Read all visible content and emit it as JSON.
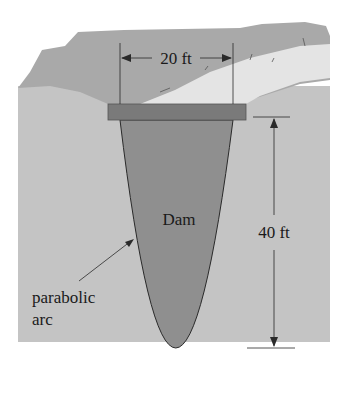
{
  "figure": {
    "dam_label": "Dam",
    "width_label": "20 ft",
    "height_label": "40 ft",
    "curve_label_line1": "parabolic",
    "curve_label_line2": "arc"
  },
  "colors": {
    "ground": "#c4c4c4",
    "hillside": "#a9a9a9",
    "water": "#e4e4e4",
    "dam_body": "#8f8f8f",
    "dam_cap": "#7a7a7a",
    "line": "#2a2a2a"
  }
}
